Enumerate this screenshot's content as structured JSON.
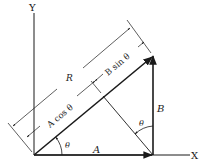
{
  "figure": {
    "axes": {
      "x_label": "X",
      "y_label": "Y"
    },
    "vectors": {
      "A": {
        "label": "A"
      },
      "B": {
        "label": "B"
      },
      "R": {
        "label": "R"
      }
    },
    "projections": {
      "a_cos": "A cos θ",
      "b_sin": "B sin θ"
    },
    "angles": {
      "theta_origin": "θ",
      "theta_b": "θ"
    },
    "colors": {
      "ink": "#1a1a1a",
      "background": "#ffffff"
    }
  }
}
